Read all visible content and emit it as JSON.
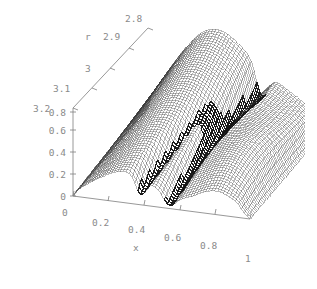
{
  "figure": {
    "background_color": "#ffffff",
    "mesh_color": "#3a3a3a",
    "fold_color": "#141414",
    "axis_color": "#7d7d7d",
    "label_color": "#8a8a8a",
    "width": 317,
    "height": 289
  },
  "axes": {
    "x": {
      "title": "x",
      "ticks": [
        "0",
        "0.2",
        "0.4",
        "0.6",
        "0.8",
        "1"
      ],
      "range": [
        0,
        1
      ]
    },
    "r": {
      "title": "r",
      "ticks": [
        "3.2",
        "3.1",
        "3",
        "2.9",
        "2.8"
      ],
      "range": [
        3.2,
        2.8
      ]
    },
    "z": {
      "title": "",
      "ticks": [
        "0",
        "0.2",
        "0.4",
        "0.6",
        "0.8"
      ],
      "range": [
        0,
        0.8
      ]
    }
  },
  "chart_data": {
    "type": "surface",
    "title": "",
    "xlabel": "x",
    "ylabel": "r",
    "zlabel": "",
    "xlim": [
      0,
      1
    ],
    "ylim": [
      3.2,
      2.8
    ],
    "zlim": [
      0,
      0.8
    ],
    "grid": false,
    "legend": "none",
    "projection": "3d-wireframe",
    "mesh": {
      "x_steps": 60,
      "y_steps": 60,
      "style": "fine-wireframe"
    },
    "x_ticks": [
      0,
      0.2,
      0.4,
      0.6,
      0.8,
      1
    ],
    "y_ticks": [
      3.2,
      3.1,
      3,
      2.9,
      2.8
    ],
    "z_ticks": [
      0,
      0.2,
      0.4,
      0.6,
      0.8
    ],
    "features": [
      {
        "name": "origin-ridge",
        "x": 0.0,
        "r": 3.2,
        "z": 0.0
      },
      {
        "name": "back-ridge-crest",
        "x": 0.35,
        "r": 2.8,
        "z": 0.78
      },
      {
        "name": "fold-node",
        "x": 0.62,
        "r": 2.98,
        "z": 0.55
      },
      {
        "name": "front-valley",
        "x": 0.55,
        "r": 3.2,
        "z": 0.18
      },
      {
        "name": "right-dropoff",
        "x": 1.0,
        "r": 3.0,
        "z": 0.0
      }
    ],
    "series": [
      {
        "name": "surface",
        "surface_formula_hint": "branching density peak with crease along r-dependent fold",
        "values": []
      }
    ]
  }
}
